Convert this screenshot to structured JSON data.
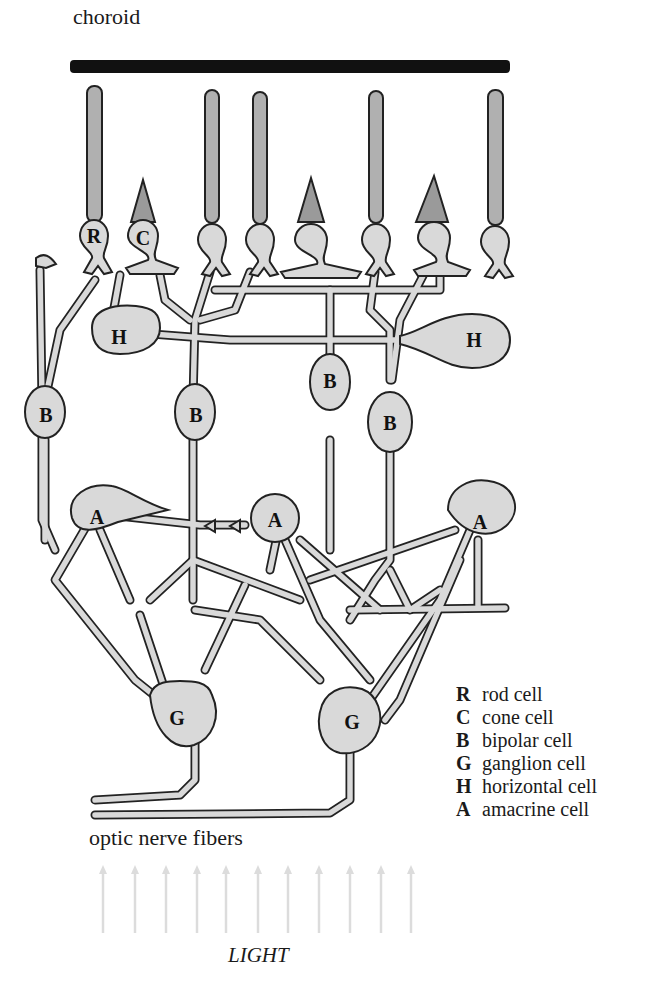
{
  "diagram": {
    "title_top": "choroid",
    "bottom_label": "optic nerve fibers",
    "light_label": "LIGHT",
    "colors": {
      "choroid": "#111111",
      "cell_fill": "#d9d9d9",
      "outer_segment": "#9a9a9a",
      "outline": "#222222",
      "light_arrows": "#dcdcdc"
    },
    "cell_labels": {
      "rod": "R",
      "cone": "C",
      "bipolar": "B",
      "ganglion": "G",
      "horizontal": "H",
      "amacrine": "A"
    },
    "light_arrow_count": 11
  },
  "legend": [
    {
      "key": "R",
      "label": "rod cell"
    },
    {
      "key": "C",
      "label": "cone cell"
    },
    {
      "key": "B",
      "label": "bipolar cell"
    },
    {
      "key": "G",
      "label": "ganglion cell"
    },
    {
      "key": "H",
      "label": "horizontal cell"
    },
    {
      "key": "A",
      "label": "amacrine cell"
    }
  ]
}
